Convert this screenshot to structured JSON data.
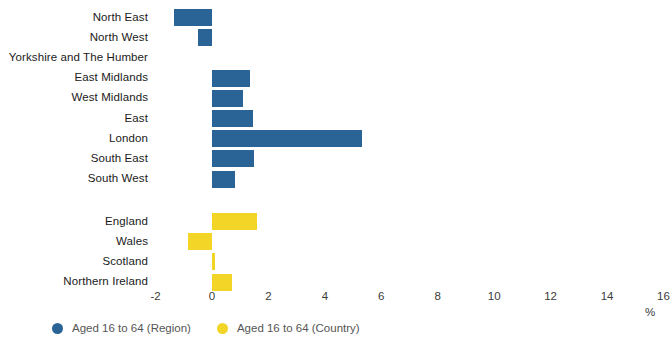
{
  "chart_data": {
    "type": "bar",
    "orientation": "horizontal",
    "title": "",
    "xlabel": "%",
    "ylabel": "",
    "xlim": [
      -2,
      16
    ],
    "xticks": [
      -2,
      0,
      2,
      4,
      6,
      8,
      10,
      12,
      14,
      16
    ],
    "xtick_labels": [
      "-2",
      "0",
      "2",
      "4",
      "6",
      "8",
      "10",
      "12",
      "14",
      "16"
    ],
    "grid": false,
    "legend_position": "bottom-left",
    "colors": {
      "region": "#2a6496",
      "country": "#f2d527"
    },
    "series": [
      {
        "name": "Aged 16 to 64 (Region)",
        "color": "#2a6496",
        "categories": [
          "North East",
          "North West",
          "Yorkshire and The Humber",
          "East Midlands",
          "West Midlands",
          "East",
          "London",
          "South East",
          "South West"
        ],
        "values": [
          -1.35,
          -0.5,
          0.0,
          1.35,
          1.1,
          1.45,
          5.3,
          1.5,
          0.8
        ]
      },
      {
        "name": "Aged 16 to 64 (Country)",
        "color": "#f2d527",
        "categories": [
          "England",
          "Wales",
          "Scotland",
          "Northern Ireland"
        ],
        "values": [
          1.6,
          -0.85,
          0.1,
          0.7
        ]
      }
    ]
  },
  "legend": {
    "items": [
      {
        "label": "Aged 16 to 64 (Region)",
        "swatch": "region"
      },
      {
        "label": "Aged 16 to 64 (Country)",
        "swatch": "country"
      }
    ]
  },
  "axis": {
    "unit_label": "%"
  }
}
